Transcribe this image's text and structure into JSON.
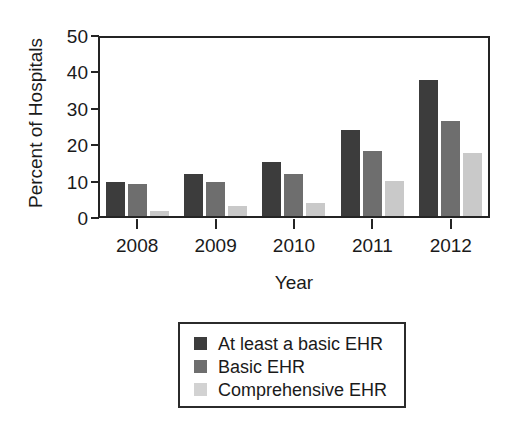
{
  "chart_data": {
    "type": "bar",
    "title": "",
    "subtitle": "",
    "xlabel": "Year",
    "ylabel": "Percent of Hospitals",
    "categories": [
      "2008",
      "2009",
      "2010",
      "2011",
      "2012"
    ],
    "ylim": [
      0,
      50
    ],
    "yticks": [
      0,
      10,
      20,
      30,
      40,
      50
    ],
    "ytick_labels": [
      "0",
      "10",
      "20",
      "30",
      "40",
      "50"
    ],
    "grid": false,
    "legend_position": "below-plot-center",
    "series": [
      {
        "name": "At least a basic EHR",
        "color": "#3c3c3c",
        "values": [
          9.4,
          11.5,
          14.8,
          23.5,
          37.5
        ]
      },
      {
        "name": "Basic EHR",
        "color": "#6e6e6e",
        "values": [
          8.7,
          9.4,
          11.5,
          17.8,
          26.2
        ]
      },
      {
        "name": "Comprehensive EHR",
        "color": "#c9c9c9",
        "values": [
          1.5,
          2.7,
          3.6,
          9.6,
          17.3
        ]
      }
    ]
  },
  "legend": {
    "items": [
      {
        "label": "At least a basic EHR",
        "color": "#3c3c3c"
      },
      {
        "label": "Basic EHR",
        "color": "#6e6e6e"
      },
      {
        "label": "Comprehensive EHR",
        "color": "#d2d2d2"
      }
    ]
  }
}
